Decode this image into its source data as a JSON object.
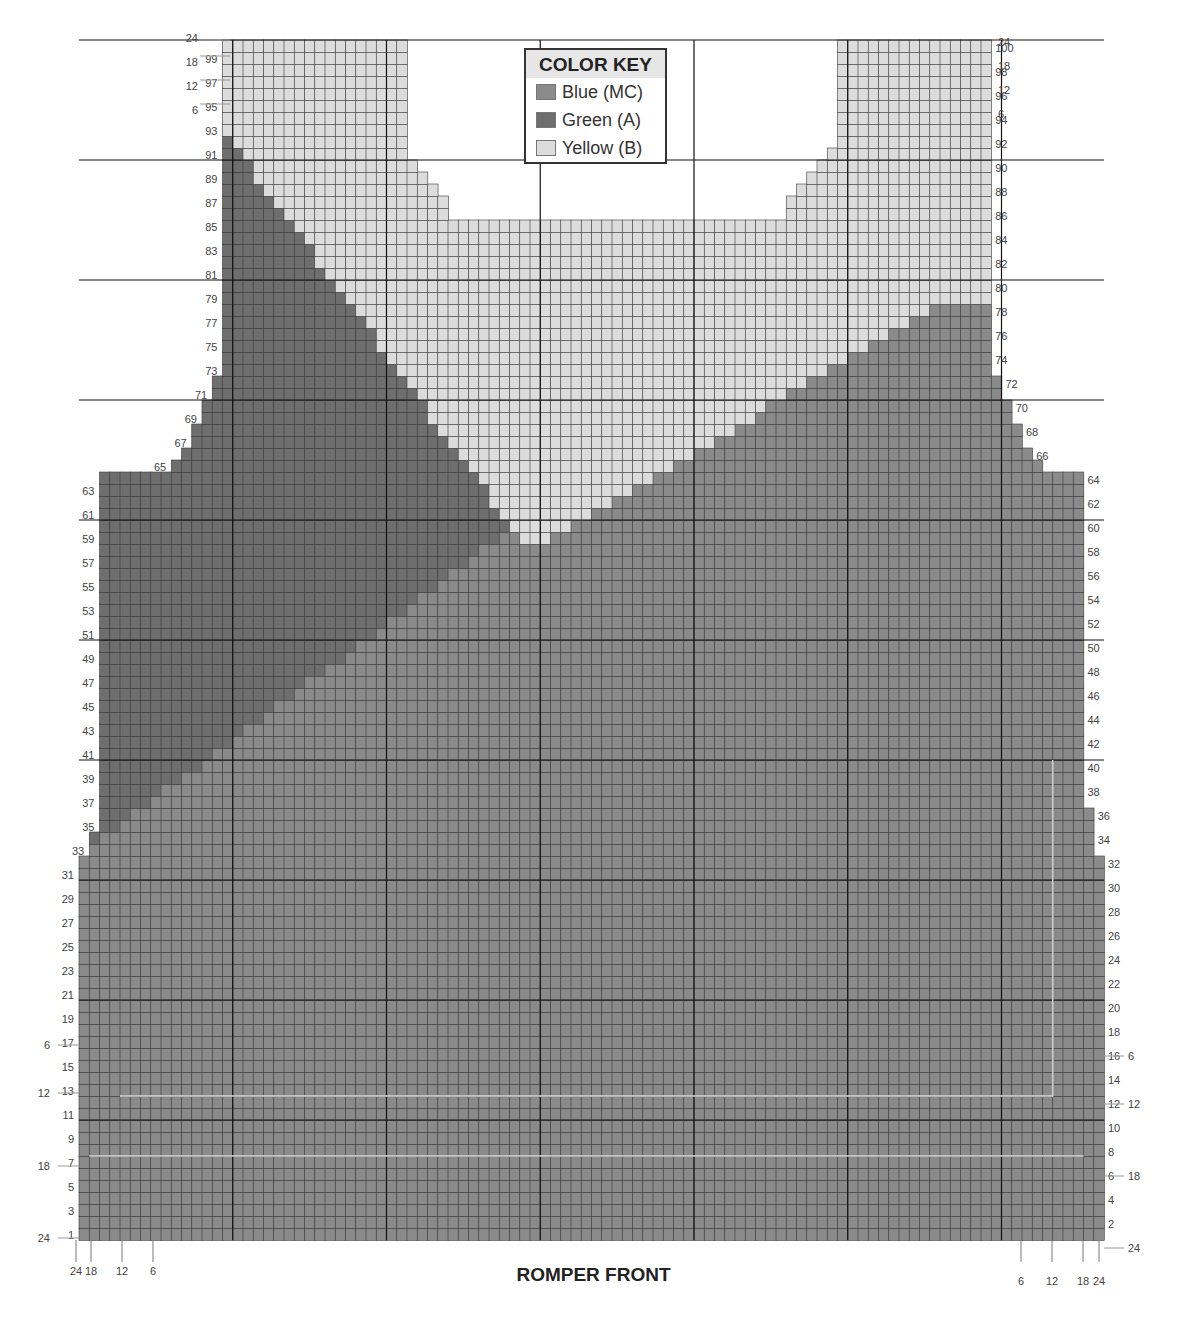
{
  "title": "ROMPER FRONT",
  "color_key": {
    "title": "COLOR KEY",
    "items": [
      {
        "label": "Blue (MC)",
        "color": "#8a8a8a"
      },
      {
        "label": "Green (A)",
        "color": "#6e6e6e"
      },
      {
        "label": "Yellow (B)",
        "color": "#dcdcdc"
      }
    ]
  },
  "colors": {
    "blue": "#8a8a8a",
    "green": "#6e6e6e",
    "yellow": "#dcdcdc",
    "grid": "#3a3a3a",
    "grid_major": "#111111",
    "size_line": "#d8d8d8"
  },
  "left_row_labels": [
    "1",
    "3",
    "5",
    "7",
    "9",
    "11",
    "13",
    "15",
    "17",
    "19",
    "21",
    "23",
    "25",
    "27",
    "29",
    "31",
    "33",
    "35",
    "37",
    "39",
    "41",
    "43",
    "45",
    "47",
    "49",
    "51",
    "53",
    "55",
    "57",
    "59",
    "61",
    "63",
    "65",
    "67",
    "69",
    "71",
    "73",
    "75",
    "77",
    "79",
    "81",
    "83",
    "85",
    "87",
    "89",
    "91",
    "93",
    "95",
    "97",
    "99"
  ],
  "right_row_labels": [
    "2",
    "4",
    "6",
    "8",
    "10",
    "12",
    "14",
    "16",
    "18",
    "20",
    "22",
    "24",
    "26",
    "28",
    "30",
    "32",
    "34",
    "36",
    "38",
    "40",
    "42",
    "44",
    "46",
    "48",
    "50",
    "52",
    "54",
    "56",
    "58",
    "60",
    "62",
    "64",
    "66",
    "68",
    "70",
    "72",
    "74",
    "76",
    "78",
    "80",
    "82",
    "84",
    "86",
    "88",
    "90",
    "92",
    "94",
    "96",
    "98",
    "100"
  ],
  "size_markers": {
    "left_side": [
      "24",
      "18",
      "12",
      "6"
    ],
    "bottom_left": [
      "24",
      "18",
      "12",
      "6"
    ],
    "bottom_right": [
      "6",
      "12",
      "18",
      "24"
    ],
    "right_side": [
      "6",
      "12",
      "18",
      "24"
    ],
    "top_left": [
      "24",
      "18",
      "12",
      "6"
    ],
    "top_right": [
      "24",
      "18",
      "12",
      "6"
    ]
  }
}
